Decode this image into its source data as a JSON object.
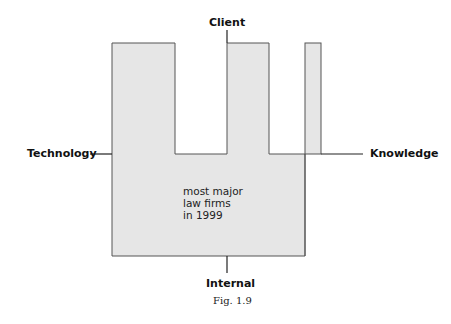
{
  "diagram": {
    "labels": {
      "top": "Client",
      "left": "Technology",
      "right": "Knowledge",
      "bottom": "Internal"
    },
    "shape_text": [
      "most major",
      "law firms",
      "in 1999"
    ],
    "caption": "Fig. 1.9",
    "colors": {
      "fill": "#e6e6e6",
      "stroke": "#555555",
      "axis": "#222222"
    }
  }
}
